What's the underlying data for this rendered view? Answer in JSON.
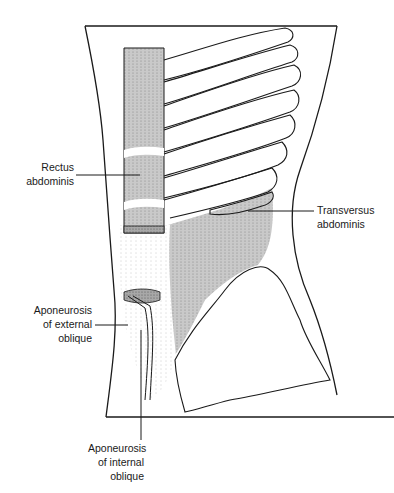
{
  "figure": {
    "colors": {
      "outline": "#1a1a1a",
      "muscle_shading": "#c7c7c7",
      "dark_shading": "#9a9a9a",
      "background": "#ffffff"
    },
    "labels": [
      {
        "id": "rectus-abdominis",
        "lines": [
          "Rectus",
          "abdominis"
        ]
      },
      {
        "id": "transversus-abdominis",
        "lines": [
          "Transversus",
          "abdominis"
        ]
      },
      {
        "id": "aponeurosis-external-oblique",
        "lines": [
          "Aponeurosis",
          "of external",
          "oblique"
        ]
      },
      {
        "id": "aponeurosis-internal-oblique",
        "lines": [
          "Aponeurosis",
          "of internal",
          "oblique"
        ]
      }
    ]
  }
}
